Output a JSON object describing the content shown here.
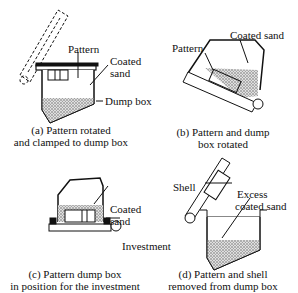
{
  "panels": [
    {
      "id": "a",
      "caption_line1": "(a) Pattern rotated",
      "caption_line2": "and clamped to dump box",
      "labels": {
        "pattern": "Pattern",
        "coated_sand_1": "Coated",
        "coated_sand_2": "sand",
        "dump_box": "Dump box"
      }
    },
    {
      "id": "b",
      "caption_line1": "(b) Pattern and dump",
      "caption_line2": "box rotated",
      "labels": {
        "pattern": "Pattern",
        "coated_sand": "Coated sand"
      }
    },
    {
      "id": "c",
      "caption_line1": "(c) Pattern dump box",
      "caption_line2": "in position for the investment",
      "labels": {
        "coated_sand_1": "Coated",
        "coated_sand_2": "sand",
        "investment": "Investment"
      }
    },
    {
      "id": "d",
      "caption_line1": "(d) Pattern and shell",
      "caption_line2": "removed from dump box",
      "labels": {
        "shell": "Shell",
        "excess_1": "Excess",
        "excess_2": "coated sand"
      }
    }
  ],
  "colors": {
    "line": "#111111",
    "sand": "#bbbbbb",
    "background": "#ffffff"
  }
}
